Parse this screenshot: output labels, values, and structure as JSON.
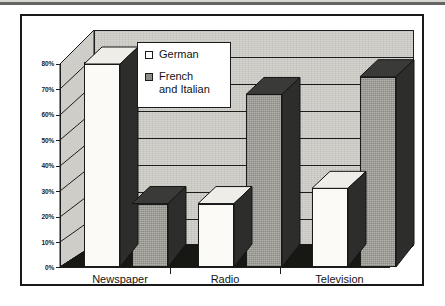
{
  "chart_data": {
    "type": "bar",
    "title": "",
    "subtitle": "",
    "xlabel": "",
    "ylabel": "",
    "categories": [
      "Newspaper",
      "Radio",
      "Television"
    ],
    "series": [
      {
        "name": "German",
        "values": [
          80,
          25,
          31
        ],
        "color": "#fbfaf6"
      },
      {
        "name": "French and Italian",
        "values": [
          25,
          68,
          75
        ],
        "color": "#a9a7a1"
      }
    ],
    "ylim": [
      0,
      80
    ],
    "ytick_values": [
      80,
      70,
      60,
      50,
      40,
      30,
      20,
      10,
      0
    ],
    "ytick_labels": [
      "80%",
      "70%",
      "60%",
      "50%",
      "40%",
      "30%",
      "20%",
      "10%",
      "0%"
    ],
    "grid": true,
    "legend_position": "upper-center",
    "three_d": true,
    "style": "scanned-grayscale"
  },
  "legend": {
    "entries": [
      {
        "label": "German",
        "label_line1": "German",
        "label_line2": "",
        "swatch": "white-square-swatch"
      },
      {
        "label": "French and Italian",
        "label_line1": "French",
        "label_line2": "and Italian",
        "swatch": "gray-square-swatch"
      }
    ]
  },
  "axes": {
    "y": {
      "ticks": [
        "80%",
        "70%",
        "60%",
        "50%",
        "40%",
        "30%",
        "20%",
        "10%",
        "0%"
      ]
    },
    "x": {
      "ticks": [
        "Newspaper",
        "Radio",
        "Television"
      ]
    }
  },
  "colors": {
    "ink": "#1a1a1a",
    "plot_background": "#d5d3cd",
    "bar_german": "#fbfaf6",
    "bar_french": "#a9a7a1",
    "bar_shadow": "#2b2b2b",
    "page_background": "#ffffff"
  }
}
